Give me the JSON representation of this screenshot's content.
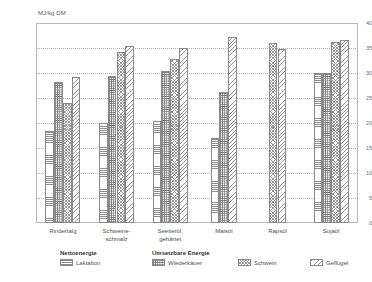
{
  "chart_data": {
    "type": "bar",
    "title": "",
    "subtitle": "",
    "xlabel": "",
    "ylabel": "MJ/kg DM",
    "ylim": [
      0,
      40
    ],
    "yticks": [
      0,
      5,
      10,
      15,
      20,
      25,
      30,
      35,
      40
    ],
    "grid": true,
    "legend_position": "bottom",
    "legend_groups": [
      {
        "heading": "Nettoenergie",
        "entries": [
          "Laktation"
        ]
      },
      {
        "heading": "Umsetzbare Energie",
        "entries": [
          "Wiederkäuer",
          "Schwein",
          "Geflügel"
        ]
      }
    ],
    "categories": [
      "Rindertalg",
      "Schweine-\nschmalz",
      "Seetieröl,\ngehärtet",
      "Maisöl",
      "Rapsöl",
      "Sojaöl"
    ],
    "series": [
      {
        "name": "Laktation",
        "pattern": "horizontal-lines",
        "values": [
          18.5,
          20.0,
          20.4,
          17.0,
          null,
          30.0
        ]
      },
      {
        "name": "Wiederkäuer",
        "pattern": "dotted-grid",
        "values": [
          28.2,
          29.5,
          30.4,
          26.3,
          null,
          30.0
        ]
      },
      {
        "name": "Schwein",
        "pattern": "cross-hatch",
        "values": [
          24.1,
          34.2,
          32.9,
          null,
          36.0,
          36.3
        ]
      },
      {
        "name": "Geflügel",
        "pattern": "diagonal-hatch",
        "values": [
          29.2,
          35.4,
          35.1,
          37.2,
          34.9,
          36.6
        ]
      }
    ]
  },
  "axis": {
    "y_title": "MJ/kg DM",
    "tick_0": "0",
    "tick_5": "5",
    "tick_10": "10",
    "tick_15": "15",
    "tick_20": "20",
    "tick_25": "25",
    "tick_30": "30",
    "tick_35": "35",
    "tick_40": "40"
  },
  "categories": {
    "c0_line1": "Rindertalg",
    "c0_line2": "",
    "c1_line1": "Schweine-",
    "c1_line2": "schmalz",
    "c2_line1": "Seetieröl,",
    "c2_line2": "gehärtet",
    "c3_line1": "Maisöl",
    "c3_line2": "",
    "c4_line1": "Rapsöl",
    "c4_line2": "",
    "c5_line1": "Sojaöl",
    "c5_line2": ""
  },
  "legend": {
    "heading_net": "Nettoenergie",
    "heading_ume": "Umsetzbare Energie",
    "item_laktation": "Laktation",
    "item_wiederkaeuer": "Wiederkäuer",
    "item_schwein": "Schwein",
    "item_gefluegel": "Geflügel"
  },
  "colors": {
    "frame": "#b9b9b9",
    "grid": "#9fb6c9",
    "bar_outline": "#8a8a8a",
    "text": "#4f4f4f"
  }
}
